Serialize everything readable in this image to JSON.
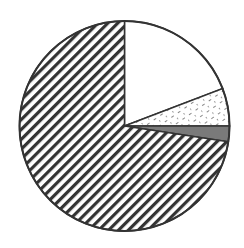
{
  "chart_data": {
    "type": "pie",
    "title": "",
    "start_angle_deg": 0,
    "direction": "clockwise",
    "slices": [
      {
        "label": "",
        "value": 19.2,
        "pattern": "solid",
        "fill": "#ffffff"
      },
      {
        "label": "",
        "value": 5.8,
        "pattern": "dotted-dashes",
        "fill": "#ffffff"
      },
      {
        "label": "",
        "value": 2.4,
        "pattern": "solid",
        "fill": "#7a7a7a"
      },
      {
        "label": "",
        "value": 72.6,
        "pattern": "diagonal-hatch",
        "fill": "#ffffff"
      }
    ],
    "legend": [],
    "stroke": "#333333"
  }
}
